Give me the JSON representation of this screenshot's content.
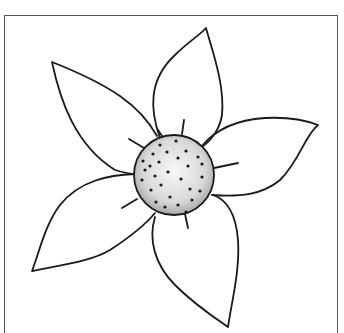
{
  "image": {
    "subject": "flower line drawing",
    "petal_count": 5,
    "center_dot_count": 28,
    "colors": {
      "background": "#ffffff",
      "stroke": "#1a1a1a",
      "frame": "#555555",
      "center_fill_light": "#f2f2f2",
      "center_fill_dark": "#b8b8b8"
    }
  }
}
